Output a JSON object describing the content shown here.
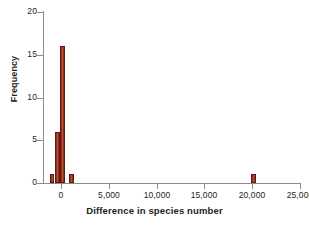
{
  "chart_data": {
    "type": "bar",
    "title": "",
    "subtitle": "",
    "xlabel": "Difference in species number",
    "ylabel": "Frequency",
    "xlim": [
      -1800,
      25000
    ],
    "ylim": [
      0,
      20
    ],
    "grid": false,
    "legend": null,
    "bar_color": "#9a2f1d",
    "bar_edge_color": "#5d1a0e",
    "axis_color": "#8c8c8c",
    "text_color": "#231f20",
    "background": "#ffffff",
    "xticks": [
      0,
      5000,
      10000,
      15000,
      20000,
      25000
    ],
    "xticklabels": [
      "0",
      "5,000",
      "10,000",
      "15,000",
      "20,000",
      "25,000"
    ],
    "yticks": [
      0,
      5,
      10,
      15,
      20
    ],
    "yticklabels": [
      "0",
      "5",
      "10",
      "15",
      "20"
    ],
    "bins": [
      {
        "x_left": -1200,
        "x_right": -700,
        "value": 1
      },
      {
        "x_left": -620,
        "x_right": -120,
        "value": 6
      },
      {
        "x_left": -100,
        "x_right": 400,
        "value": 16
      },
      {
        "x_left": 800,
        "x_right": 1300,
        "value": 1
      },
      {
        "x_left": 19900,
        "x_right": 20400,
        "value": 1
      }
    ],
    "values": [
      1,
      6,
      16,
      1,
      1
    ]
  }
}
